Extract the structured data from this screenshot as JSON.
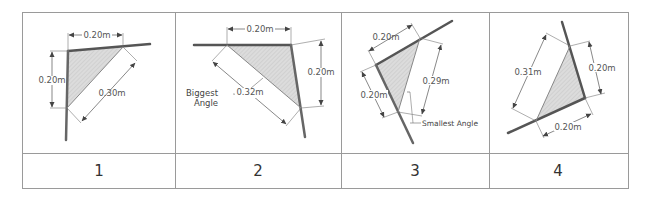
{
  "table": {
    "panels": [
      {
        "number": "1",
        "dimensions": [
          "0.20m",
          "0.20m",
          "0.30m"
        ],
        "annotation": ""
      },
      {
        "number": "2",
        "dimensions": [
          "0.20m",
          "0.20m",
          "0.32m"
        ],
        "annotation": "Biggest Angle",
        "annotation_lines": [
          "Biggest",
          "Angle"
        ]
      },
      {
        "number": "3",
        "dimensions": [
          "0.20m",
          "0.29m",
          "0.20m"
        ],
        "annotation": "Smallest Angle"
      },
      {
        "number": "4",
        "dimensions": [
          "0.31m",
          "0.20m",
          "0.20m"
        ],
        "annotation": ""
      }
    ]
  },
  "colors": {
    "grid": "#999999",
    "fill": "#d8d8d8",
    "line": "#555555"
  }
}
